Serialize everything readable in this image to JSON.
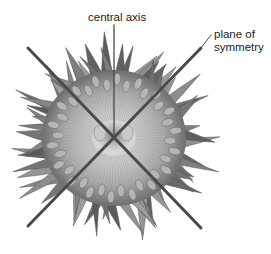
{
  "diagram": {
    "labels": {
      "central_axis": "central axis",
      "plane_of_symmetry_line1": "plane of",
      "plane_of_symmetry_line2": "symmetry"
    },
    "colors": {
      "background": "#ffffff",
      "line": "#4a4a4a",
      "body_light": "#c8c8c8",
      "body_dark": "#5a5a5a",
      "text": "#222222"
    },
    "center": [
      114,
      138
    ]
  }
}
